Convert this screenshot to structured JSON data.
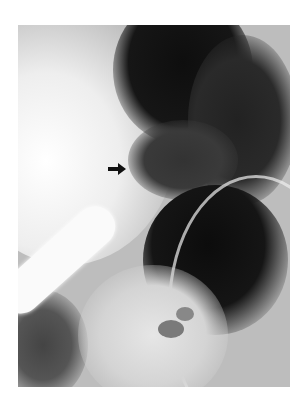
{
  "image": {
    "type": "radiograph",
    "description": "Abdominal X-ray showing gas-distended bowel loops with a bright radiopaque tube at lower left",
    "annotation": {
      "shape": "arrow",
      "direction": "right",
      "color": "#111111"
    },
    "colors": {
      "background": "#ffffff",
      "dark_gas": "#141414",
      "bright": "#f4f4f4"
    }
  }
}
